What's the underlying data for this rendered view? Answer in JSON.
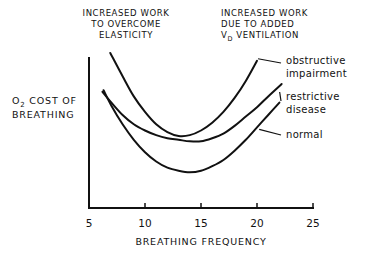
{
  "chart_data": {
    "type": "line",
    "title": "",
    "xlabel": "BREATHING FREQUENCY",
    "ylabel": "O2 COST OF BREATHING",
    "ylabel_parts": {
      "o": "O",
      "sub": "2",
      "rest": " COST OF",
      "line2": "BREATHING"
    },
    "xlim": [
      5,
      25
    ],
    "ylim": [
      0,
      100
    ],
    "xticks": [
      "5",
      "10",
      "15",
      "20",
      "25"
    ],
    "xtick_values": [
      5,
      10,
      15,
      20,
      25
    ],
    "grid": false,
    "annotations": {
      "left": [
        "INCREASED WORK",
        "TO OVERCOME",
        "ELASTICITY"
      ],
      "right": {
        "line1": "INCREASED WORK",
        "line2": "DUE  TO ADDED",
        "line3_main": "V",
        "line3_sub": "D",
        "line3_rest": " VENTILATION"
      }
    },
    "series": [
      {
        "name": "obstructive impairment",
        "label_lines": [
          "obstructive",
          "impairment"
        ],
        "x": [
          6.9,
          8,
          9,
          10,
          11,
          12,
          13,
          14,
          15,
          16,
          17,
          18,
          19,
          20
        ],
        "y": [
          100,
          85,
          72,
          62,
          54,
          49,
          46.5,
          47,
          50,
          55,
          62,
          71,
          82,
          95
        ]
      },
      {
        "name": "restrictive disease",
        "label_lines": [
          "restrictive",
          "disease"
        ],
        "x": [
          6.2,
          7,
          8,
          9,
          10,
          11,
          12,
          13,
          14,
          15,
          16,
          17,
          18,
          19,
          20,
          21,
          22.2
        ],
        "y": [
          75,
          68,
          60,
          54,
          50,
          47,
          45,
          44,
          43,
          43,
          45,
          48,
          53,
          59,
          65,
          72,
          80
        ]
      },
      {
        "name": "normal",
        "label_lines": [
          "normal"
        ],
        "x": [
          6.3,
          7,
          8,
          9,
          10,
          11,
          12,
          13,
          14,
          15,
          16,
          17,
          18,
          19,
          20,
          21,
          22
        ],
        "y": [
          76,
          66,
          54,
          44,
          36,
          30,
          26,
          24,
          23,
          24,
          27,
          31,
          37,
          44,
          52,
          60,
          68
        ]
      }
    ]
  }
}
